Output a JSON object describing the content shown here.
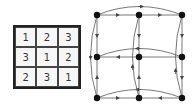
{
  "latin_square": {
    "rows": [
      [
        "1",
        "2",
        "3"
      ],
      [
        "3",
        "1",
        "2"
      ],
      [
        "2",
        "3",
        "1"
      ]
    ]
  },
  "graph": {
    "nodes": [
      {
        "id": "a1",
        "x": 97,
        "y": 15
      },
      {
        "id": "a2",
        "x": 139,
        "y": 15
      },
      {
        "id": "a3",
        "x": 182,
        "y": 15
      },
      {
        "id": "b1",
        "x": 97,
        "y": 57
      },
      {
        "id": "b2",
        "x": 139,
        "y": 57
      },
      {
        "id": "b3",
        "x": 182,
        "y": 57
      },
      {
        "id": "c1",
        "x": 97,
        "y": 98
      },
      {
        "id": "c2",
        "x": 139,
        "y": 98
      },
      {
        "id": "c3",
        "x": 182,
        "y": 98
      }
    ],
    "edge_color": "#444444",
    "node_color": "#111111"
  }
}
